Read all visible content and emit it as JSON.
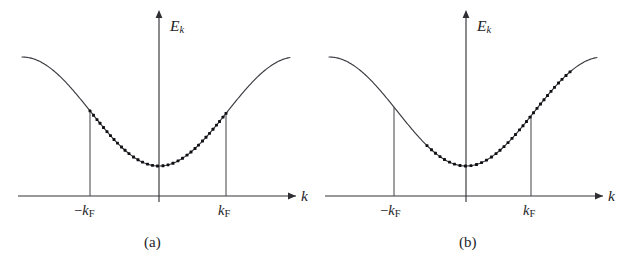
{
  "figure": {
    "kind": "energy-band-diagram",
    "background_color": "#ffffff",
    "ink_color": "#232327",
    "dot_color": "#111115"
  },
  "panels": [
    {
      "id": "a",
      "caption": "(a)",
      "caption_x": 158,
      "caption_y": 243,
      "description": "Equilibrium: occupied states fill symmetrically from -kF to +kF",
      "origin_x": 159,
      "baseline_y": 196,
      "axis": {
        "y_label": "E",
        "y_sub": "k",
        "y_label_x": 170,
        "y_label_y": 18,
        "y_top_y": 16,
        "y_bottom_y": 202,
        "x_label": "k",
        "x_label_x": 301,
        "x_label_y": 188,
        "x_left_x": 18,
        "x_right_x": 296
      },
      "ticks": [
        {
          "label_minus": "−",
          "label_k": "k",
          "label_sub": "F",
          "x": 90,
          "text_x": 74,
          "text_y": 203
        },
        {
          "label_minus": "",
          "label_k": "k",
          "label_sub": "F",
          "x": 226,
          "text_x": 218,
          "text_y": 203
        }
      ],
      "fermi_lines": [
        {
          "x": 90,
          "y_top": 118,
          "y_bottom": 196
        },
        {
          "x": 226,
          "y_top": 118,
          "y_bottom": 196
        }
      ],
      "occupied_range": {
        "x_start": 90,
        "x_end": 226
      }
    },
    {
      "id": "b",
      "caption": "(b)",
      "caption_x": 473,
      "caption_y": 243,
      "description": "Current-carrying state: occupied states shifted toward +k",
      "origin_x": 466,
      "baseline_y": 196,
      "axis": {
        "y_label": "E",
        "y_sub": "k",
        "y_label_x": 477,
        "y_label_y": 18,
        "y_top_y": 16,
        "y_bottom_y": 202,
        "x_label": "k",
        "x_label_x": 608,
        "x_label_y": 188,
        "x_left_x": 325,
        "x_right_x": 603
      },
      "ticks": [
        {
          "label_minus": "−",
          "label_k": "k",
          "label_sub": "F",
          "x": 394,
          "text_x": 380,
          "text_y": 203
        },
        {
          "label_minus": "",
          "label_k": "k",
          "label_sub": "F",
          "x": 531,
          "text_x": 523,
          "text_y": 203
        }
      ],
      "fermi_lines": [
        {
          "x": 394,
          "y_top": 118,
          "y_bottom": 196
        },
        {
          "x": 531,
          "y_top": 118,
          "y_bottom": 196
        }
      ],
      "occupied_range": {
        "x_start": 427,
        "x_end": 570
      }
    }
  ],
  "chart_data": {
    "type": "line",
    "title": "",
    "xlabel": "k",
    "ylabel": "E_k",
    "grid": false,
    "legend": null,
    "band_model": {
      "form": "E(k) = E_min + A * (1 - cos(pi * k / k_max)) / 2",
      "note": "cosine-like tight-binding band, minimum at k = 0",
      "curve_min_y_px": 166,
      "curve_max_y_px": 57,
      "half_period_px": 137
    },
    "panels": [
      {
        "name": "(a) equilibrium",
        "k_fermi": 1.0,
        "occupied_k_range": [
          -1.0,
          1.0
        ],
        "shift": 0.0,
        "n_dots": 34
      },
      {
        "name": "(b) drift / current-carrying",
        "k_fermi": 1.0,
        "occupied_k_range": [
          -0.49,
          1.52
        ],
        "shift": 0.52,
        "n_dots": 34
      }
    ],
    "x_ticks": [
      "-k_F",
      "0",
      "k_F"
    ],
    "y_ticks": []
  }
}
